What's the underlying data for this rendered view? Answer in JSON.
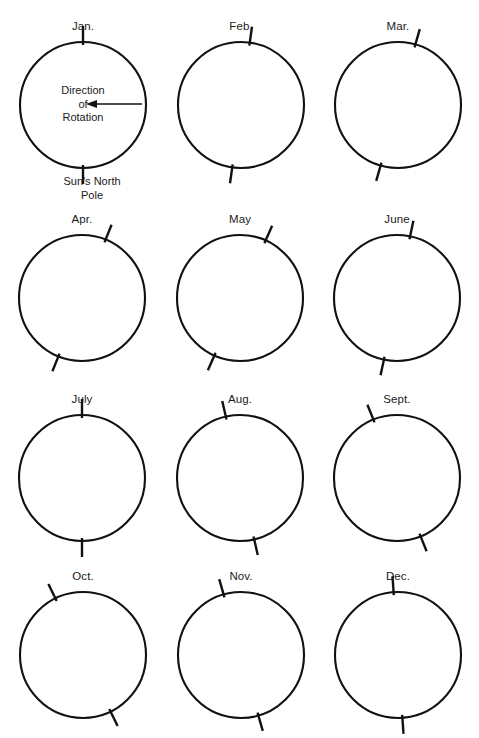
{
  "figure": {
    "background_color": "#ffffff",
    "ink_color": "#111111",
    "columns": 3,
    "rows": 4
  },
  "annotations": {
    "rotation_label_line1": "Direction",
    "rotation_label_line2": "of",
    "rotation_label_line3": "Rotation",
    "rotation_arrow_icon": "left-arrow-icon",
    "rotation_arrow_direction": "left",
    "pole_label_line1": "Sun's North",
    "pole_label_line2": "Pole"
  },
  "chart_data": {
    "type": "diagram",
    "units": "degrees from vertical (positive = top tilted right / east)",
    "radius_px": 63,
    "tick_length_px": 16,
    "categories": [
      "Jan.",
      "Feb.",
      "Mar.",
      "Apr.",
      "May",
      "June",
      "July",
      "Aug.",
      "Sept.",
      "Oct.",
      "Nov.",
      "Dec."
    ],
    "values": [
      0,
      8,
      16,
      22,
      24,
      12,
      0,
      -13,
      -22,
      -26,
      -16,
      -4
    ],
    "panels": [
      {
        "label": "Jan.",
        "tilt_deg": 0,
        "center_x": 83,
        "center_y": 105
      },
      {
        "label": "Feb.",
        "tilt_deg": 8,
        "center_x": 241,
        "center_y": 105
      },
      {
        "label": "Mar.",
        "tilt_deg": 16,
        "center_x": 398,
        "center_y": 105
      },
      {
        "label": "Apr.",
        "tilt_deg": 22,
        "center_x": 82,
        "center_y": 298
      },
      {
        "label": "May",
        "tilt_deg": 24,
        "center_x": 240,
        "center_y": 298
      },
      {
        "label": "June",
        "tilt_deg": 12,
        "center_x": 397,
        "center_y": 298
      },
      {
        "label": "July",
        "tilt_deg": 0,
        "center_x": 82,
        "center_y": 478
      },
      {
        "label": "Aug.",
        "tilt_deg": -13,
        "center_x": 240,
        "center_y": 478
      },
      {
        "label": "Sept.",
        "tilt_deg": -22,
        "center_x": 397,
        "center_y": 478
      },
      {
        "label": "Oct.",
        "tilt_deg": -26,
        "center_x": 83,
        "center_y": 655
      },
      {
        "label": "Nov.",
        "tilt_deg": -16,
        "center_x": 241,
        "center_y": 655
      },
      {
        "label": "Dec.",
        "tilt_deg": -4,
        "center_x": 398,
        "center_y": 655
      }
    ]
  }
}
